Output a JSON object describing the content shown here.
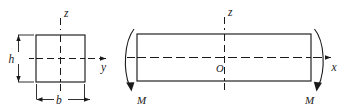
{
  "figure": {
    "colors": {
      "ink": "#1a1a1a",
      "background": "#ffffff"
    },
    "cross_section": {
      "shape": "rectangle",
      "labels": {
        "width": "b",
        "height": "h",
        "axis_vertical": "z",
        "axis_horizontal": "y"
      }
    },
    "beam": {
      "shape": "rectangle",
      "labels": {
        "axis_vertical": "z",
        "axis_longitudinal": "x",
        "origin": "O",
        "moment_left": "M",
        "moment_right": "M"
      }
    }
  }
}
